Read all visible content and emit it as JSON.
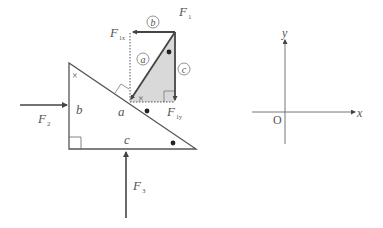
{
  "diagram": {
    "force_labels": {
      "F1": {
        "main": "F",
        "sub": "1"
      },
      "F1x": {
        "main": "F",
        "sub": "1x"
      },
      "F1y": {
        "main": "F",
        "sub": "1y"
      },
      "F2": {
        "main": "F",
        "sub": "2"
      },
      "F3": {
        "main": "F",
        "sub": "3"
      }
    },
    "side_labels": {
      "a": "a",
      "b": "b",
      "c": "c"
    },
    "circled_labels": {
      "a": "a",
      "b": "b",
      "c": "c"
    },
    "angle_marks": {
      "cross": "×",
      "dot": "●"
    },
    "axes": {
      "x_label": "x",
      "y_label": "y",
      "origin_label": "O"
    },
    "colors": {
      "line": "#444444",
      "shade": "#d9d9d9",
      "text": "#555555"
    }
  }
}
